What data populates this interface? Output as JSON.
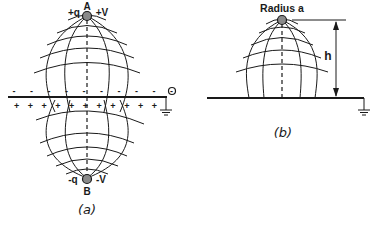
{
  "figure_a": {
    "top_charge": "+q",
    "top_point": "A",
    "top_potential": "+V",
    "bottom_charge": "-q",
    "bottom_point": "B",
    "bottom_potential": "-V",
    "induced_top_sign": "- - - - - - - - - - -",
    "induced_bottom_sign": "+ + + + + + + + + + +",
    "terminal_label": "O",
    "caption": "(a)"
  },
  "figure_b": {
    "sphere_label": "Radius a",
    "height_label": "h",
    "caption": "(b)"
  },
  "colors": {
    "ink": "#1a1a1a",
    "background": "#ffffff",
    "sphere_fill": "#8a8a8a"
  }
}
